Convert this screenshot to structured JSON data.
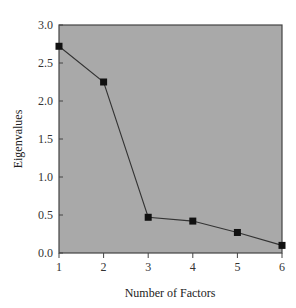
{
  "chart_data": {
    "type": "line",
    "title": "",
    "xlabel": "Number of Factors",
    "ylabel": "Eigenvalues",
    "x": [
      1,
      2,
      3,
      4,
      5,
      6
    ],
    "series": [
      {
        "name": "Eigenvalues",
        "values": [
          2.72,
          2.25,
          0.47,
          0.42,
          0.27,
          0.1
        ]
      }
    ],
    "xlim": [
      1,
      6
    ],
    "ylim": [
      0,
      3.0
    ],
    "xticks": [
      "1",
      "2",
      "3",
      "4",
      "5",
      "6"
    ],
    "yticks": [
      "0.0",
      "0.5",
      "1.0",
      "1.5",
      "2.0",
      "2.5",
      "3.0"
    ],
    "grid": false,
    "legend": "none",
    "colors": {
      "plot_background": "#a9a9a9",
      "line": "#333333",
      "marker": "#111111"
    }
  }
}
